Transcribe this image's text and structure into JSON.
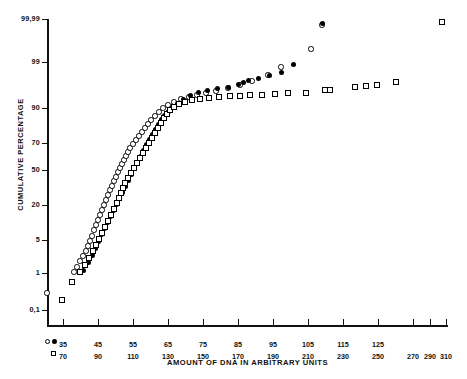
{
  "chart_data": {
    "type": "scatter",
    "title": "",
    "xlabel": "AMOUNT OF DNA IN ARBITRARY UNITS",
    "ylabel": "CUMULATIVE PERCENTAGE",
    "y_scale": "probability",
    "y_ticks": [
      "99,99",
      "99",
      "90",
      "70",
      "50",
      "20",
      "5",
      "1",
      "0,1"
    ],
    "y_tick_values": [
      99.99,
      99,
      90,
      70,
      50,
      20,
      5,
      1,
      0.1
    ],
    "x_axis_primary": {
      "legend_markers": [
        "circle-open",
        "circle-filled"
      ],
      "ticks": [
        "35",
        "45",
        "55",
        "65",
        "75",
        "85",
        "95",
        "105",
        "115",
        "125"
      ],
      "tick_values": [
        35,
        45,
        55,
        65,
        75,
        85,
        95,
        105,
        115,
        125
      ]
    },
    "x_axis_secondary": {
      "legend_markers": [
        "square-open"
      ],
      "ticks": [
        "70",
        "90",
        "110",
        "130",
        "150",
        "170",
        "190",
        "210",
        "230",
        "250",
        "270",
        "290",
        "310"
      ],
      "tick_values": [
        70,
        90,
        110,
        130,
        150,
        170,
        190,
        210,
        230,
        250,
        270,
        290,
        310
      ]
    },
    "grid": false,
    "legend_position": "x-axis-left",
    "series": [
      {
        "name": "open-circle",
        "marker": "circle-open",
        "points": [
          [
            47,
            293
          ],
          [
            74,
            272
          ],
          [
            77,
            267
          ],
          [
            80,
            261
          ],
          [
            83,
            256
          ],
          [
            86,
            251
          ],
          [
            88,
            246
          ],
          [
            90,
            241
          ],
          [
            92,
            236
          ],
          [
            94,
            230
          ],
          [
            96,
            225
          ],
          [
            98,
            220
          ],
          [
            100,
            215
          ],
          [
            102,
            210
          ],
          [
            104,
            205
          ],
          [
            106,
            200
          ],
          [
            108,
            195
          ],
          [
            110,
            190
          ],
          [
            112,
            186
          ],
          [
            114,
            181
          ],
          [
            116,
            177
          ],
          [
            118,
            172
          ],
          [
            120,
            168
          ],
          [
            122,
            164
          ],
          [
            124,
            160
          ],
          [
            126,
            156
          ],
          [
            128,
            152
          ],
          [
            130,
            148
          ],
          [
            133,
            144
          ],
          [
            136,
            140
          ],
          [
            139,
            136
          ],
          [
            142,
            132
          ],
          [
            145,
            128
          ],
          [
            148,
            124
          ],
          [
            151,
            120
          ],
          [
            155,
            116
          ],
          [
            159,
            112
          ],
          [
            163,
            108
          ],
          [
            168,
            105
          ],
          [
            174,
            102
          ],
          [
            181,
            99
          ],
          [
            189,
            97
          ],
          [
            197,
            95
          ],
          [
            206,
            93
          ],
          [
            216,
            91
          ],
          [
            228,
            88
          ],
          [
            240,
            85
          ],
          [
            252,
            81
          ],
          [
            268,
            75
          ],
          [
            281,
            67
          ],
          [
            311,
            49
          ],
          [
            322,
            25
          ]
        ]
      },
      {
        "name": "filled-circle",
        "marker": "circle-filled",
        "points": [
          [
            83,
            270
          ],
          [
            88,
            262
          ],
          [
            92,
            255
          ],
          [
            95,
            248
          ],
          [
            98,
            241
          ],
          [
            101,
            234
          ],
          [
            104,
            228
          ],
          [
            107,
            222
          ],
          [
            110,
            216
          ],
          [
            113,
            210
          ],
          [
            116,
            204
          ],
          [
            119,
            198
          ],
          [
            122,
            192
          ],
          [
            125,
            186
          ],
          [
            128,
            180
          ],
          [
            131,
            174
          ],
          [
            134,
            168
          ],
          [
            137,
            162
          ],
          [
            140,
            156
          ],
          [
            143,
            150
          ],
          [
            146,
            144
          ],
          [
            149,
            139
          ],
          [
            152,
            134
          ],
          [
            155,
            129
          ],
          [
            158,
            124
          ],
          [
            161,
            119
          ],
          [
            164,
            115
          ],
          [
            168,
            111
          ],
          [
            172,
            107
          ],
          [
            177,
            103
          ],
          [
            183,
            99
          ],
          [
            190,
            95
          ],
          [
            198,
            92
          ],
          [
            207,
            90
          ],
          [
            217,
            88
          ],
          [
            228,
            87
          ],
          [
            238,
            84
          ],
          [
            243,
            82
          ],
          [
            248,
            80
          ],
          [
            258,
            78
          ],
          [
            269,
            75
          ],
          [
            281,
            72
          ],
          [
            293,
            64
          ],
          [
            322,
            23
          ]
        ]
      },
      {
        "name": "open-square",
        "marker": "square-open",
        "points": [
          [
            62,
            300
          ],
          [
            72,
            282
          ],
          [
            80,
            272
          ],
          [
            85,
            265
          ],
          [
            89,
            258
          ],
          [
            93,
            251
          ],
          [
            96,
            245
          ],
          [
            99,
            239
          ],
          [
            102,
            233
          ],
          [
            105,
            227
          ],
          [
            108,
            221
          ],
          [
            111,
            215
          ],
          [
            114,
            209
          ],
          [
            117,
            203
          ],
          [
            119,
            198
          ],
          [
            121,
            193
          ],
          [
            123,
            188
          ],
          [
            125,
            183
          ],
          [
            128,
            178
          ],
          [
            131,
            173
          ],
          [
            134,
            168
          ],
          [
            137,
            163
          ],
          [
            140,
            158
          ],
          [
            143,
            153
          ],
          [
            146,
            148
          ],
          [
            149,
            143
          ],
          [
            152,
            138
          ],
          [
            155,
            133
          ],
          [
            158,
            128
          ],
          [
            161,
            123
          ],
          [
            164,
            118
          ],
          [
            167,
            114
          ],
          [
            170,
            110
          ],
          [
            174,
            107
          ],
          [
            179,
            104
          ],
          [
            185,
            102
          ],
          [
            192,
            100
          ],
          [
            200,
            99
          ],
          [
            209,
            98
          ],
          [
            219,
            97
          ],
          [
            230,
            96
          ],
          [
            240,
            96
          ],
          [
            250,
            95
          ],
          [
            262,
            95
          ],
          [
            275,
            94
          ],
          [
            288,
            93
          ],
          [
            306,
            93
          ],
          [
            325,
            90
          ],
          [
            330,
            90
          ],
          [
            355,
            87
          ],
          [
            366,
            86
          ],
          [
            377,
            85
          ],
          [
            396,
            82
          ],
          [
            442,
            22
          ]
        ]
      }
    ]
  },
  "layout": {
    "plot": {
      "x_left": 47,
      "x_right": 448,
      "y_top": 19,
      "y_bottom": 326
    },
    "y_tick_pixels": [
      19,
      62,
      108,
      143,
      170,
      205,
      240,
      273,
      310
    ],
    "x_tick_pixels_primary": [
      63,
      98,
      133,
      168,
      203,
      238,
      273,
      308,
      343,
      378
    ],
    "x_tick_pixels_secondary": [
      63,
      98,
      133,
      168,
      203,
      238,
      273,
      308,
      343,
      378,
      413,
      430,
      446
    ],
    "legend_row1_y": 340,
    "legend_row2_y": 352
  }
}
